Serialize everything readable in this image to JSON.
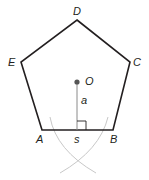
{
  "diagram": {
    "vertices": {
      "A": "A",
      "B": "B",
      "C": "C",
      "D": "D",
      "E": "E"
    },
    "center_label": "O",
    "apothem_label": "a",
    "side_label": "s",
    "colors": {
      "outline": "#231f20",
      "apothem": "#8a8a8a",
      "arcs": "#c8c8c8",
      "center_dot": "#555555"
    }
  }
}
